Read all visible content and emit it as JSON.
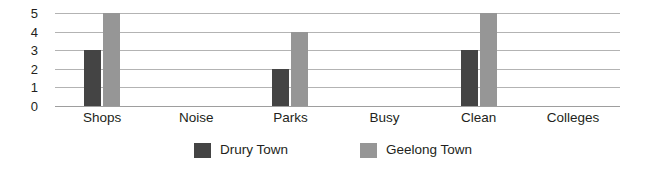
{
  "chart_data": {
    "type": "bar",
    "title": "",
    "subtitle": "",
    "xlabel": "",
    "ylabel": "",
    "categories": [
      "Shops",
      "Noise",
      "Parks",
      "Busy",
      "Clean",
      "Colleges"
    ],
    "series": [
      {
        "name": "Drury Town",
        "color": "#444444",
        "values": [
          3,
          0,
          2,
          0,
          3,
          0
        ]
      },
      {
        "name": "Geelong Town",
        "color": "#969696",
        "values": [
          5,
          0,
          4,
          0,
          5,
          0
        ]
      }
    ],
    "ylim": [
      0,
      5
    ],
    "yticks": [
      "0",
      "1",
      "2",
      "3",
      "4",
      "5"
    ],
    "grid": true,
    "grid_color": "#b3b3b3",
    "legend_position": "bottom",
    "orientation": "vertical"
  }
}
